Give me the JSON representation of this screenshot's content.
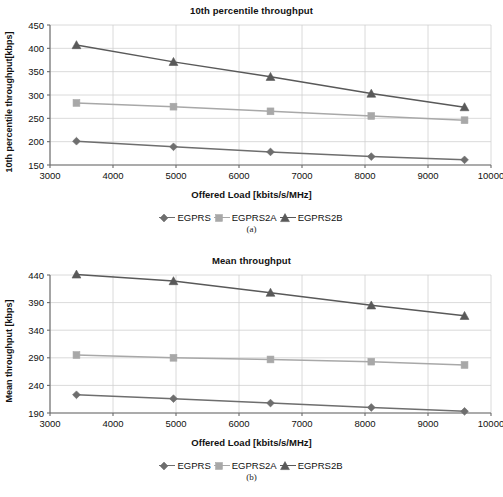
{
  "figures": [
    {
      "id": "a",
      "caption": "(a)",
      "chart": {
        "title": "10th percentile throughput",
        "xlabel": "Offered Load [kbits/s/MHz]",
        "ylabel": "10th percentile throughput[kbps]"
      },
      "legend": [
        {
          "label": "EGPRS",
          "marker": "diamond",
          "color": "#6e6e6e"
        },
        {
          "label": "EGPRS2A",
          "marker": "square",
          "color": "#a8a8a8"
        },
        {
          "label": "EGPRS2B",
          "marker": "triangle",
          "color": "#595959"
        }
      ]
    },
    {
      "id": "b",
      "caption": "(b)",
      "chart": {
        "title": "Mean throughput",
        "xlabel": "Offered Load [kbits/s/MHz]",
        "ylabel": "Mean throughput [kbps]"
      },
      "legend": [
        {
          "label": "EGPRS",
          "marker": "diamond",
          "color": "#6e6e6e"
        },
        {
          "label": "EGPRS2A",
          "marker": "square",
          "color": "#a8a8a8"
        },
        {
          "label": "EGPRS2B",
          "marker": "triangle",
          "color": "#595959"
        }
      ]
    }
  ],
  "chart_data": [
    {
      "type": "line",
      "id": "a",
      "title": "10th percentile throughput",
      "xlabel": "Offered Load [kbits/s/MHz]",
      "ylabel": "10th percentile throughput[kbps]",
      "x": [
        3420,
        4960,
        6500,
        8100,
        9580
      ],
      "xticks": [
        3000,
        4000,
        5000,
        6000,
        7000,
        8000,
        9000,
        10000
      ],
      "yticks": [
        150,
        200,
        250,
        300,
        350,
        400,
        450
      ],
      "xlim": [
        3000,
        10000
      ],
      "ylim": [
        150,
        450
      ],
      "grid": true,
      "legend_position": "bottom",
      "series": [
        {
          "name": "EGPRS",
          "marker": "diamond",
          "color": "#6e6e6e",
          "values": [
            201,
            189,
            178,
            168,
            161
          ]
        },
        {
          "name": "EGPRS2A",
          "marker": "square",
          "color": "#a8a8a8",
          "values": [
            283,
            275,
            265,
            255,
            246
          ]
        },
        {
          "name": "EGPRS2B",
          "marker": "triangle",
          "color": "#595959",
          "values": [
            407,
            371,
            339,
            303,
            274
          ]
        }
      ]
    },
    {
      "type": "line",
      "id": "b",
      "title": "Mean throughput",
      "xlabel": "Offered Load [kbits/s/MHz]",
      "ylabel": "Mean throughput [kbps]",
      "x": [
        3420,
        4960,
        6500,
        8100,
        9580
      ],
      "xticks": [
        3000,
        4000,
        5000,
        6000,
        7000,
        8000,
        9000,
        10000
      ],
      "yticks": [
        190,
        240,
        290,
        340,
        390,
        440
      ],
      "xlim": [
        3000,
        10000
      ],
      "ylim": [
        190,
        440
      ],
      "grid": true,
      "legend_position": "bottom",
      "series": [
        {
          "name": "EGPRS",
          "marker": "diamond",
          "color": "#6e6e6e",
          "values": [
            223,
            216,
            208,
            200,
            193
          ]
        },
        {
          "name": "EGPRS2A",
          "marker": "square",
          "color": "#a8a8a8",
          "values": [
            295,
            290,
            287,
            283,
            277
          ]
        },
        {
          "name": "EGPRS2B",
          "marker": "triangle",
          "color": "#595959",
          "values": [
            441,
            429,
            408,
            385,
            366
          ]
        }
      ]
    }
  ]
}
